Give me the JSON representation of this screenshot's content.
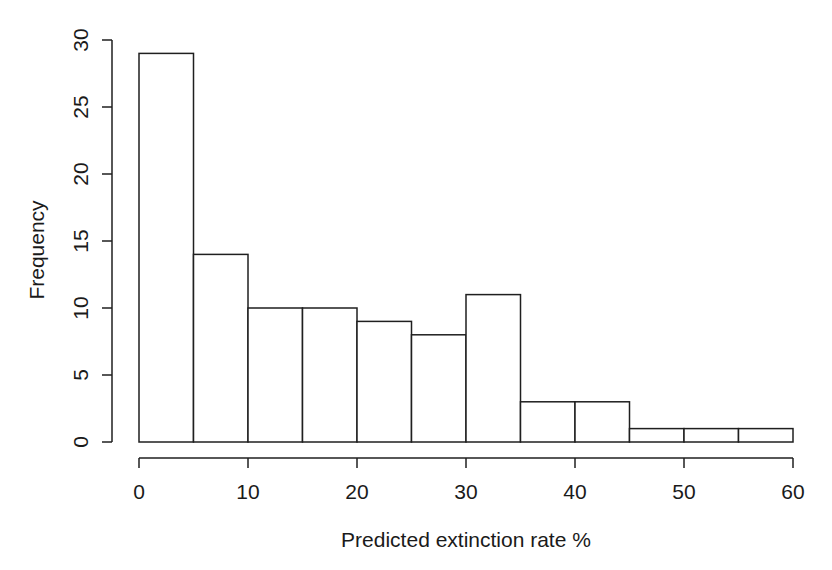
{
  "chart_data": {
    "type": "bar",
    "subtype": "histogram",
    "title": "",
    "xlabel": "Predicted extinction rate %",
    "ylabel": "Frequency",
    "bin_edges": [
      0,
      5,
      10,
      15,
      20,
      25,
      30,
      35,
      40,
      45,
      50,
      55,
      60
    ],
    "values": [
      29,
      14,
      10,
      10,
      9,
      8,
      11,
      3,
      3,
      1,
      1,
      1
    ],
    "x_ticks": [
      0,
      10,
      20,
      30,
      40,
      50,
      60
    ],
    "y_ticks": [
      0,
      5,
      10,
      15,
      20,
      25,
      30
    ],
    "xlim": [
      0,
      60
    ],
    "ylim": [
      0,
      30
    ],
    "grid": false,
    "legend": "none",
    "bar_fill": "#ffffff",
    "line_color": "#1f1f1f",
    "text_color": "#1a1a1a",
    "background": "#ffffff"
  }
}
